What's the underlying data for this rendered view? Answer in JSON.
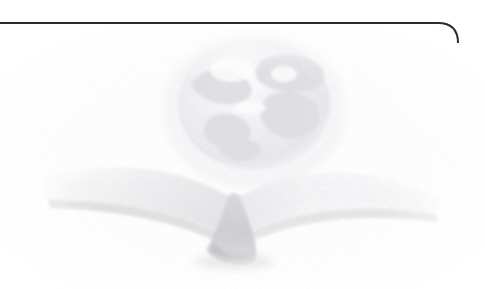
{
  "page": {
    "width": 485,
    "height": 289,
    "background_color": "#ffffff"
  },
  "frame": {
    "rule_color": "#2b2b2e",
    "rule_thickness_px": 2,
    "rule_y_px": 23,
    "corner_radius_px": 20,
    "corner_x_px": 458,
    "right_edge_fade_end_y_px": 205,
    "name": "page-border-rule"
  },
  "artwork": {
    "title": "Open book with globe",
    "style": "faded halftone watermark",
    "ink_color": "#d8d8dc",
    "shadow_color": "#c4c4c8",
    "globe": {
      "name": "globe",
      "center_x_px": 254,
      "center_y_px": 104,
      "radius_x_px": 76,
      "radius_y_px": 66,
      "landmass_labels": [
        "north-america",
        "south-america",
        "africa",
        "eurasia"
      ]
    },
    "book": {
      "name": "open-book",
      "left_tip_x_px": 42,
      "right_tip_x_px": 441,
      "spine_x_px": 232,
      "top_y_px": 158,
      "bottom_y_px": 266
    }
  }
}
